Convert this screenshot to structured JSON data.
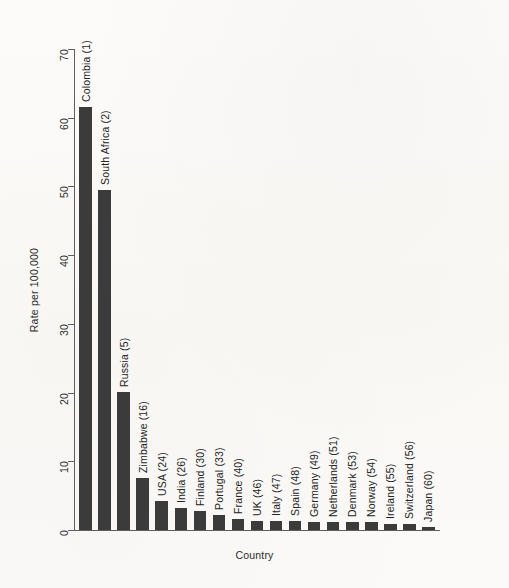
{
  "chart_data": {
    "type": "bar",
    "title": "",
    "xlabel": "Country",
    "ylabel": "Rate per 100,000",
    "ylim": [
      0,
      70
    ],
    "yticks": [
      0,
      10,
      20,
      30,
      40,
      50,
      60,
      70
    ],
    "grid": false,
    "legend": "none",
    "bar_color": "#3b3b3b",
    "categories": [
      "Colombia (1)",
      "South Africa (2)",
      "Russia (5)",
      "Zimbabwe (16)",
      "USA (24)",
      "India (26)",
      "Finland (30)",
      "Portugal (33)",
      "France (40)",
      "UK (46)",
      "Italy (47)",
      "Spain (48)",
      "Germany (49)",
      "Netherlands (51)",
      "Denmark (53)",
      "Norway (54)",
      "Ireland (55)",
      "Switzerland (56)",
      "Japan (60)"
    ],
    "values": [
      61.5,
      49.5,
      20.1,
      7.5,
      4.2,
      3.2,
      2.7,
      2.2,
      1.6,
      1.3,
      1.3,
      1.3,
      1.2,
      1.2,
      1.1,
      1.1,
      0.9,
      0.9,
      0.5
    ]
  },
  "axis": {
    "y_title": "Rate per 100,000",
    "x_title": "Country",
    "y_tick_labels": [
      "0",
      "10",
      "20",
      "30",
      "40",
      "50",
      "60",
      "70"
    ]
  }
}
